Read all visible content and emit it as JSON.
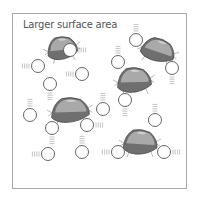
{
  "diagram": {
    "title": "Larger surface area",
    "colors": {
      "frame": "#a8a8a8",
      "rock_light": "#a9a9a9",
      "rock_dark": "#6f6f6f",
      "rock_outline": "#444444",
      "particle_fill": "#ffffff",
      "particle_stroke": "#555555",
      "motion_lines": "#9a9a9a"
    },
    "rocks": [
      {
        "id": "rock-1",
        "cx": 62,
        "cy": 48,
        "w": 30,
        "h": 22,
        "rot": -10
      },
      {
        "id": "rock-2",
        "cx": 158,
        "cy": 50,
        "w": 34,
        "h": 22,
        "rot": 15
      },
      {
        "id": "rock-3",
        "cx": 134,
        "cy": 80,
        "w": 34,
        "h": 24,
        "rot": -5
      },
      {
        "id": "rock-4",
        "cx": 70,
        "cy": 110,
        "w": 38,
        "h": 24,
        "rot": -5
      },
      {
        "id": "rock-5",
        "cx": 140,
        "cy": 142,
        "w": 34,
        "h": 24,
        "rot": 0
      }
    ],
    "particles": [
      {
        "cx": 70,
        "cy": 50,
        "lines": "right"
      },
      {
        "cx": 38,
        "cy": 66,
        "lines": "left"
      },
      {
        "cx": 50,
        "cy": 84,
        "lines": "down"
      },
      {
        "cx": 82,
        "cy": 74,
        "lines": "left"
      },
      {
        "cx": 118,
        "cy": 62,
        "lines": "up"
      },
      {
        "cx": 136,
        "cy": 40,
        "lines": "up"
      },
      {
        "cx": 172,
        "cy": 68,
        "lines": "down"
      },
      {
        "cx": 125,
        "cy": 100,
        "lines": "down"
      },
      {
        "cx": 30,
        "cy": 115,
        "lines": "up"
      },
      {
        "cx": 103,
        "cy": 109,
        "lines": "up"
      },
      {
        "cx": 52,
        "cy": 128,
        "lines": "down"
      },
      {
        "cx": 87,
        "cy": 125,
        "lines": "right"
      },
      {
        "cx": 155,
        "cy": 120,
        "lines": "up"
      },
      {
        "cx": 48,
        "cy": 154,
        "lines": "left"
      },
      {
        "cx": 82,
        "cy": 152,
        "lines": "up"
      },
      {
        "cx": 118,
        "cy": 152,
        "lines": "left"
      },
      {
        "cx": 164,
        "cy": 152,
        "lines": "right"
      }
    ]
  }
}
